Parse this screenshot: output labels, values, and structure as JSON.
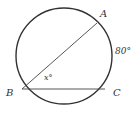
{
  "diagram": {
    "type": "circle-geometry",
    "circle": {
      "cx": 64,
      "cy": 56,
      "r": 48,
      "stroke": "#333333"
    },
    "points": {
      "A": {
        "label": "A",
        "x": 97,
        "y": 21
      },
      "B": {
        "label": "B",
        "x": 22,
        "y": 89
      },
      "C": {
        "label": "C",
        "x": 105,
        "y": 89
      }
    },
    "segments": [
      {
        "from": "B",
        "to": "A"
      },
      {
        "from": "B",
        "to": "C"
      }
    ],
    "arc_label": {
      "text": "80°",
      "arc": "AC"
    },
    "angle_label": {
      "text": "x°",
      "vertex": "B"
    },
    "colors": {
      "line": "#333333",
      "background": "#ffffff"
    }
  }
}
